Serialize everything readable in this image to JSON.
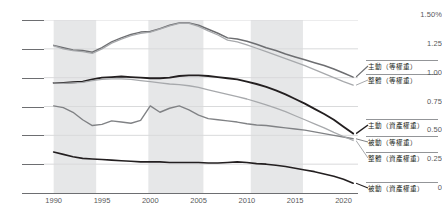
{
  "chart_data": {
    "type": "line",
    "title": "",
    "xlabel": "",
    "ylabel": "",
    "xlim": [
      1989.0,
      2021.5
    ],
    "ylim": [
      0,
      1.5
    ],
    "grid": true,
    "legend_position": "right",
    "x": [
      1990,
      1991,
      1992,
      1993,
      1994,
      1995,
      1996,
      1997,
      1998,
      1999,
      2000,
      2001,
      2002,
      2003,
      2004,
      2005,
      2006,
      2007,
      2008,
      2009,
      2010,
      2011,
      2012,
      2013,
      2014,
      2015,
      2016,
      2017,
      2018,
      2019,
      2020,
      2021
    ],
    "y_ticklabels": [
      "1.50%",
      "1.25",
      "1.00",
      "0.75",
      "0.50",
      "0.25",
      "0"
    ],
    "y_tickvalues": [
      1.5,
      1.25,
      1.0,
      0.75,
      0.5,
      0.25,
      0
    ],
    "x_ticklabels": [
      "1990",
      "1995",
      "2000",
      "2005",
      "2010",
      "2015",
      "2020"
    ],
    "x_tickvalues": [
      1990,
      1995,
      2000,
      2005,
      2010,
      2015,
      2020
    ],
    "shaded_bands": [
      {
        "start": 1990.0,
        "end": 1994.4
      },
      {
        "start": 1999.8,
        "end": 2005.5
      },
      {
        "start": 2010.4,
        "end": 2015.8
      }
    ],
    "series": [
      {
        "name": "主動（等權重）",
        "color": "#6d6e71",
        "width": 1.5,
        "legend_y": 68,
        "values": [
          1.28,
          1.26,
          1.24,
          1.235,
          1.22,
          1.26,
          1.31,
          1.345,
          1.375,
          1.395,
          1.4,
          1.425,
          1.455,
          1.475,
          1.475,
          1.455,
          1.42,
          1.385,
          1.345,
          1.335,
          1.315,
          1.29,
          1.26,
          1.235,
          1.205,
          1.18,
          1.155,
          1.13,
          1.105,
          1.075,
          1.04,
          1.005
        ]
      },
      {
        "name": "整體（等權重）",
        "color": "#a7a9ac",
        "width": 1.3,
        "legend_y": 82,
        "values": [
          1.275,
          1.25,
          1.235,
          1.225,
          1.21,
          1.25,
          1.3,
          1.335,
          1.365,
          1.385,
          1.395,
          1.42,
          1.45,
          1.47,
          1.47,
          1.445,
          1.405,
          1.37,
          1.325,
          1.31,
          1.285,
          1.255,
          1.225,
          1.195,
          1.165,
          1.135,
          1.105,
          1.07,
          1.035,
          1.0,
          0.965,
          0.935
        ]
      },
      {
        "name": "主動（資產權重）",
        "color": "#231f20",
        "width": 1.9,
        "legend_y": 127,
        "values": [
          0.955,
          0.955,
          0.96,
          0.965,
          0.985,
          1.0,
          1.005,
          1.01,
          1.005,
          1.0,
          0.995,
          0.995,
          1.0,
          1.015,
          1.02,
          1.02,
          1.015,
          1.005,
          0.995,
          0.985,
          0.965,
          0.945,
          0.92,
          0.89,
          0.855,
          0.815,
          0.775,
          0.73,
          0.685,
          0.635,
          0.575,
          0.515
        ]
      },
      {
        "name": "被動（等權重）",
        "color": "#808285",
        "width": 1.4,
        "legend_y": 144,
        "values": [
          0.755,
          0.74,
          0.7,
          0.635,
          0.585,
          0.595,
          0.625,
          0.615,
          0.605,
          0.63,
          0.755,
          0.7,
          0.735,
          0.755,
          0.72,
          0.675,
          0.645,
          0.635,
          0.625,
          0.615,
          0.6,
          0.59,
          0.585,
          0.575,
          0.565,
          0.555,
          0.545,
          0.53,
          0.515,
          0.5,
          0.485,
          0.47
        ]
      },
      {
        "name": "整體（資產權重）",
        "color": "#a7a9ac",
        "width": 1.3,
        "legend_y": 160,
        "values": [
          0.955,
          0.95,
          0.955,
          0.96,
          0.975,
          0.985,
          0.99,
          0.99,
          0.985,
          0.975,
          0.965,
          0.955,
          0.945,
          0.94,
          0.93,
          0.915,
          0.895,
          0.875,
          0.855,
          0.835,
          0.815,
          0.79,
          0.765,
          0.735,
          0.705,
          0.67,
          0.635,
          0.6,
          0.565,
          0.525,
          0.49,
          0.455
        ]
      },
      {
        "name": "被動（資產權重）",
        "color": "#231f20",
        "width": 1.6,
        "legend_y": 190,
        "values": [
          0.355,
          0.335,
          0.315,
          0.3,
          0.295,
          0.29,
          0.285,
          0.28,
          0.275,
          0.27,
          0.27,
          0.27,
          0.265,
          0.265,
          0.265,
          0.265,
          0.26,
          0.26,
          0.265,
          0.27,
          0.265,
          0.255,
          0.25,
          0.24,
          0.23,
          0.215,
          0.2,
          0.185,
          0.165,
          0.145,
          0.12,
          0.085
        ]
      }
    ]
  },
  "axis": {
    "y_unit_label": "1.50%"
  }
}
